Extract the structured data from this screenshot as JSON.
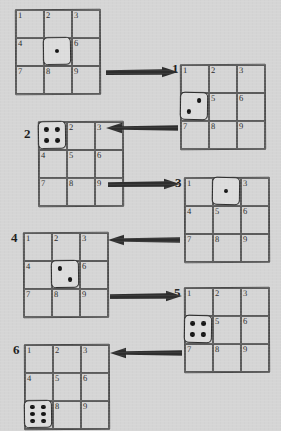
{
  "figure": {
    "background_color": "#d5d5d5",
    "ink_color": "#2e2e2e",
    "grid_line_color": "#5c5c5c",
    "pip_color": "#141414",
    "cell_numbers": [
      "1",
      "2",
      "3",
      "4",
      "5",
      "6",
      "7",
      "8",
      "9"
    ],
    "arrow_right_glyph": "arrow-right",
    "arrow_left_glyph": "arrow-left"
  },
  "states": [
    {
      "step_label": "",
      "die_cell": "5",
      "die_face": "1",
      "pips": [
        [
          50,
          50
        ]
      ],
      "grid_left": 16,
      "grid_top": 10,
      "label_left": 4,
      "label_top": 40,
      "show_label": false
    },
    {
      "step_label": "1",
      "die_cell": "4",
      "die_face": "2",
      "pips": [
        [
          70,
          28
        ],
        [
          30,
          72
        ]
      ],
      "grid_left": 181,
      "grid_top": 65,
      "label_left": 172,
      "label_top": 62,
      "show_label": true
    },
    {
      "step_label": "2",
      "die_cell": "1",
      "die_face": "4",
      "pips": [
        [
          29,
          29
        ],
        [
          71,
          29
        ],
        [
          29,
          71
        ],
        [
          71,
          71
        ]
      ],
      "grid_left": 39,
      "grid_top": 122,
      "label_left": 24,
      "label_top": 127,
      "show_label": true
    },
    {
      "step_label": "3",
      "die_cell": "2",
      "die_face": "1",
      "pips": [
        [
          50,
          50
        ]
      ],
      "grid_left": 185,
      "grid_top": 178,
      "label_left": 175,
      "label_top": 176,
      "show_label": true
    },
    {
      "step_label": "4",
      "die_cell": "5",
      "die_face": "2",
      "pips": [
        [
          30,
          28
        ],
        [
          70,
          72
        ]
      ],
      "grid_left": 24,
      "grid_top": 233,
      "label_left": 11,
      "label_top": 231,
      "show_label": true
    },
    {
      "step_label": "5",
      "die_cell": "4",
      "die_face": "4",
      "pips": [
        [
          29,
          29
        ],
        [
          71,
          29
        ],
        [
          29,
          71
        ],
        [
          71,
          71
        ]
      ],
      "grid_left": 185,
      "grid_top": 288,
      "label_left": 174,
      "label_top": 286,
      "show_label": true
    },
    {
      "step_label": "6",
      "die_cell": "7",
      "die_face": "6",
      "pips": [
        [
          28,
          23
        ],
        [
          72,
          23
        ],
        [
          28,
          50
        ],
        [
          72,
          50
        ],
        [
          28,
          77
        ],
        [
          72,
          77
        ]
      ],
      "grid_left": 25,
      "grid_top": 345,
      "label_left": 13,
      "label_top": 343,
      "show_label": true
    }
  ],
  "arrows": [
    {
      "direction": "right",
      "left": 106,
      "top": 66,
      "width": 72
    },
    {
      "direction": "left",
      "left": 106,
      "top": 122,
      "width": 72
    },
    {
      "direction": "right",
      "left": 108,
      "top": 178,
      "width": 72
    },
    {
      "direction": "left",
      "left": 108,
      "top": 234,
      "width": 72
    },
    {
      "direction": "right",
      "left": 110,
      "top": 290,
      "width": 72
    },
    {
      "direction": "left",
      "left": 110,
      "top": 347,
      "width": 72
    }
  ]
}
